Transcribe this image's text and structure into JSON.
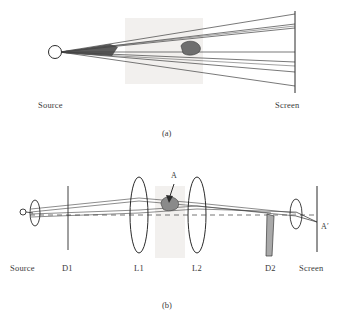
{
  "figure": {
    "panel_a": {
      "caption": "(a)",
      "source_label": "Source",
      "screen_label": "Screen",
      "description": "Point source emitting a fan of rays onto a screen, with a small opaque inhomogeneity in the beam",
      "source_point": {
        "x": 58,
        "y": 52
      },
      "screen_x": 295,
      "screen_top": 12,
      "screen_bottom": 92,
      "rays_screen_y": [
        14,
        24,
        28,
        52,
        62,
        72,
        86
      ],
      "blob": {
        "x": 188,
        "y": 47,
        "w": 14,
        "h": 9
      },
      "shade_patch": {
        "x": 125,
        "y": 18,
        "w": 78,
        "h": 66,
        "color": "#f2f0ee"
      }
    },
    "panel_b": {
      "caption": "(b)",
      "axis_y": 215,
      "components": [
        {
          "name": "source",
          "label": "Source",
          "label_x": 10,
          "x": 24,
          "type": "point-source"
        },
        {
          "name": "lens-0",
          "label": "",
          "label_x": 0,
          "x": 35,
          "type": "lens"
        },
        {
          "name": "aperture-d1",
          "label": "D1",
          "label_x": 63,
          "x": 68,
          "type": "vertical-line"
        },
        {
          "name": "lens-l1",
          "label": "L1",
          "label_x": 135,
          "x": 139,
          "type": "lens"
        },
        {
          "name": "lens-l2",
          "label": "L2",
          "label_x": 194,
          "x": 197,
          "type": "lens"
        },
        {
          "name": "knife-edge-d2",
          "label": "D2",
          "label_x": 266,
          "x": 271,
          "type": "wedge"
        },
        {
          "name": "screen",
          "label": "Screen",
          "label_x": 299,
          "x": 317,
          "type": "vertical-line"
        }
      ],
      "object_label": "A",
      "image_label": "A′",
      "object": {
        "x": 168,
        "y": 205,
        "w": 15,
        "h": 10
      },
      "object_arrow": {
        "from_x": 174,
        "from_y": 183,
        "to_x": 169,
        "to_y": 202
      },
      "shade_patch": {
        "x": 155,
        "y": 186,
        "w": 30,
        "h": 72,
        "color": "#f2f0ee"
      },
      "optical_axis_dashed": true
    }
  },
  "colors": {
    "ink": "#2b2b2b",
    "ray": "#3f3f3f",
    "blob_fill": "#6e6e6e",
    "wedge_fill": "#a9a9a9",
    "shade": "#f2f0ee",
    "label": "#3a3a3a"
  }
}
